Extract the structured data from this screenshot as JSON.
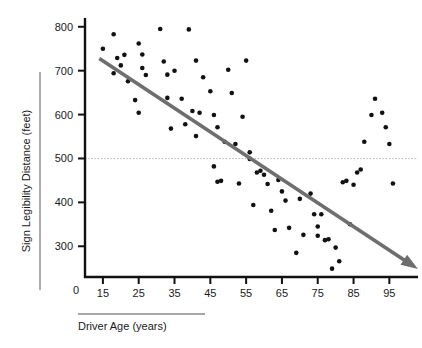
{
  "chart_data": {
    "type": "scatter",
    "title": "",
    "xlabel": "Driver Age (years)",
    "ylabel": "Sign Legibility Distance (feet)",
    "xlim": [
      10,
      103
    ],
    "ylim": [
      230,
      820
    ],
    "xticks": [
      15,
      25,
      35,
      45,
      55,
      65,
      75,
      85,
      95
    ],
    "yticks": [
      300,
      400,
      500,
      600,
      700,
      800
    ],
    "zero_label": "0",
    "grid": false,
    "legend": "none",
    "point_color": "#111111",
    "trendline_color": "#6e6e6e",
    "reference_line": {
      "axis": "y",
      "value": 500,
      "style": "dotted",
      "color": "#b9b9b9"
    },
    "trendline": {
      "x_start": 14,
      "y_start": 728,
      "x_end": 103,
      "y_end": 248,
      "arrow_end": true
    },
    "x": [
      15,
      18,
      18,
      19,
      20,
      21,
      22,
      24,
      25,
      25,
      26,
      26,
      27,
      31,
      32,
      33,
      33,
      34,
      35,
      37,
      38,
      39,
      40,
      41,
      41,
      42,
      43,
      45,
      46,
      46,
      47,
      47,
      48,
      49,
      50,
      51,
      52,
      53,
      54,
      55,
      56,
      56,
      57,
      58,
      59,
      60,
      61,
      62,
      63,
      64,
      65,
      66,
      67,
      69,
      70,
      71,
      73,
      74,
      75,
      75,
      76,
      77,
      78,
      79,
      80,
      81,
      82,
      83,
      84,
      85,
      86,
      87,
      88,
      90,
      91,
      93,
      94,
      95,
      96
    ],
    "y": [
      750,
      783,
      694,
      729,
      712,
      736,
      676,
      633,
      762,
      604,
      706,
      737,
      690,
      795,
      721,
      638,
      691,
      568,
      700,
      636,
      578,
      794,
      608,
      551,
      723,
      604,
      685,
      653,
      482,
      599,
      571,
      447,
      449,
      538,
      702,
      649,
      533,
      443,
      595,
      723,
      499,
      514,
      394,
      468,
      472,
      463,
      442,
      381,
      337,
      451,
      425,
      404,
      342,
      285,
      408,
      326,
      420,
      373,
      345,
      324,
      373,
      314,
      316,
      249,
      297,
      266,
      446,
      449,
      350,
      440,
      468,
      475,
      538,
      599,
      636,
      604,
      571,
      533,
      443
    ],
    "n_points": 79
  },
  "labels": {
    "y_axis_title": "Sign Legibility Distance (feet)",
    "x_axis_title": "Driver Age (years)",
    "origin": "0"
  }
}
